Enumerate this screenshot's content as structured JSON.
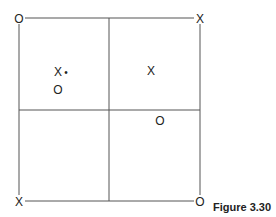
{
  "diagram": {
    "caption": "Figure 3.30",
    "corners": {
      "top_left": "O",
      "top_right": "X",
      "bottom_left": "X",
      "bottom_right": "O"
    },
    "interior_marks": {
      "upper_left_x": "X",
      "upper_left_dot": "•",
      "upper_left_o": "O",
      "upper_right_x": "X",
      "lower_right_o": "O"
    },
    "line_color": "#555555"
  }
}
